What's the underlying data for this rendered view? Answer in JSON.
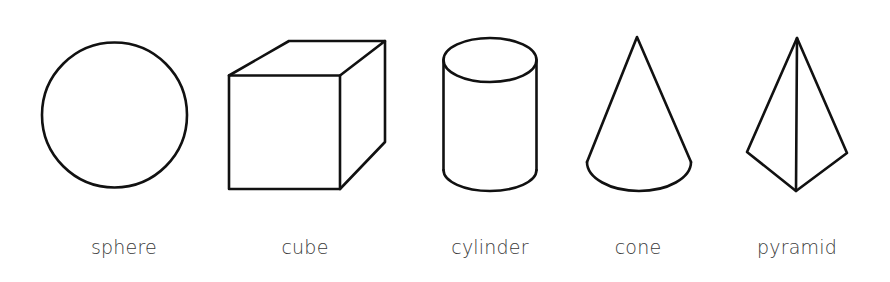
{
  "figure": {
    "shapes": [
      {
        "id": "sphere",
        "label": "sphere",
        "label_x": 124
      },
      {
        "id": "cube",
        "label": "cube",
        "label_x": 305
      },
      {
        "id": "cylinder",
        "label": "cylinder",
        "label_x": 490
      },
      {
        "id": "cone",
        "label": "cone",
        "label_x": 638
      },
      {
        "id": "pyramid",
        "label": "pyramid",
        "label_x": 797
      }
    ],
    "stroke_color": "#111111",
    "label_color": "#3a3a3a",
    "background": "#ffffff"
  }
}
